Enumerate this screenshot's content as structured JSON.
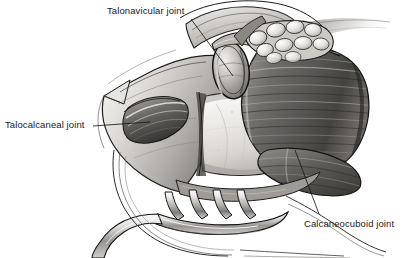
{
  "figure": {
    "type": "grayscale-medical-illustration",
    "width": 402,
    "height": 258,
    "background_color": "#ffffff",
    "ink_color": "#1a1a1a"
  },
  "annotations": [
    {
      "id": "talonavicular",
      "label": "Talonavicular joint",
      "text_color": "#1a1a1a",
      "leader_line": {
        "x1": 191,
        "y1": 19,
        "x2": 233,
        "y2": 76
      }
    },
    {
      "id": "talocalcaneal",
      "label": "Talocalcaneal joint",
      "text_color": "#1a1a1a",
      "leader_line": {
        "x1": 93,
        "y1": 126,
        "x2": 150,
        "y2": 122
      }
    },
    {
      "id": "calcaneocuboid",
      "label": "Calcaneocuboid joint",
      "text_color": "#1a1a1a",
      "leader_line": {
        "x1": 319,
        "y1": 214,
        "x2": 295,
        "y2": 150
      }
    }
  ],
  "structures": [
    {
      "name": "talar-head-articular-surface",
      "description": "oval articular dome, upper centre"
    },
    {
      "name": "fat-globule-cluster",
      "description": "cobblestone lobules, upper right of talar head"
    },
    {
      "name": "peroneal-muscle-belly",
      "description": "large striated dark muscle mass, right side"
    },
    {
      "name": "exposed-bone-surface",
      "description": "pale rectangular cancellous surface, centre"
    },
    {
      "name": "sinus-tarsi-recess",
      "description": "dark concave pocket, left of centre"
    },
    {
      "name": "retracted-skin-flap",
      "description": "pointed flap apex, far left"
    },
    {
      "name": "rake-retractor",
      "description": "four-prong retractor, lower centre"
    },
    {
      "name": "retractor-handle",
      "description": "curved shaft sweeping to lower left"
    }
  ],
  "palette": {
    "paper": "#ffffff",
    "lightest_tissue": "#f2f1ef",
    "mid_tissue": "#b9b7b4",
    "dark_tissue": "#6d6b69",
    "deepest_shadow": "#2a2928",
    "outline": "#171717",
    "metal_highlight": "#e8e8e6",
    "metal_shadow": "#4a4a4a"
  }
}
